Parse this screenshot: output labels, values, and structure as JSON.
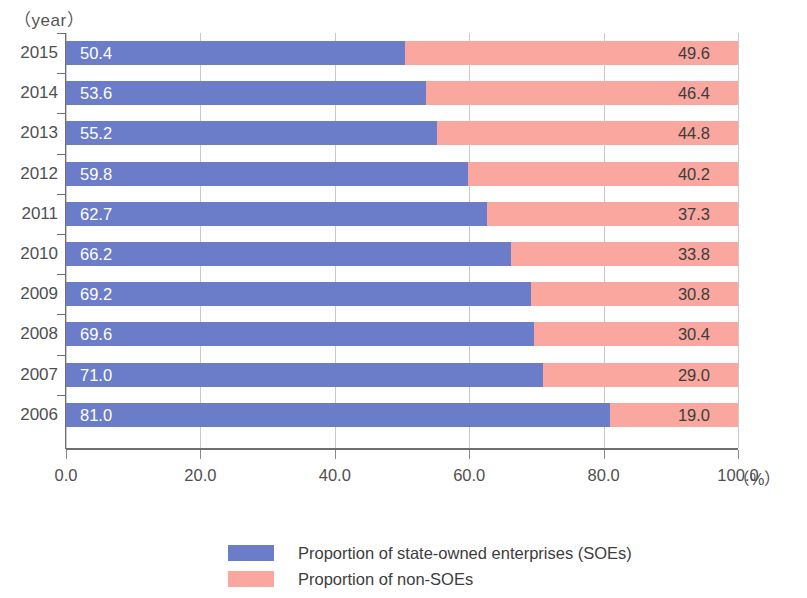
{
  "chart_data": {
    "type": "bar",
    "subtype": "stacked-horizontal-100-percent",
    "title": "",
    "xlabel": "(%)",
    "ylabel": "(year)",
    "xlim": [
      0,
      100
    ],
    "xticks": [
      "0.0",
      "20.0",
      "40.0",
      "60.0",
      "80.0",
      "100.0"
    ],
    "xtick_values": [
      0,
      20,
      40,
      60,
      80,
      100
    ],
    "grid": true,
    "grid_axis": "x",
    "legend_position": "bottom",
    "categories": [
      "2015",
      "2014",
      "2013",
      "2012",
      "2011",
      "2010",
      "2009",
      "2008",
      "2007",
      "2006"
    ],
    "series": [
      {
        "name": "Proportion of state-owned enterprises (SOEs)",
        "color": "#6b7cc8",
        "values": [
          50.4,
          53.6,
          55.2,
          59.8,
          62.7,
          66.2,
          69.2,
          69.6,
          71.0,
          81.0
        ],
        "labels": [
          "50.4",
          "53.6",
          "55.2",
          "59.8",
          "62.7",
          "66.2",
          "69.2",
          "69.6",
          "71.0",
          "81.0"
        ]
      },
      {
        "name": "Proportion of non-SOEs",
        "color": "#f9a79f",
        "values": [
          49.6,
          46.4,
          44.8,
          40.2,
          37.3,
          33.8,
          30.8,
          30.4,
          29.0,
          19.0
        ],
        "labels": [
          "49.6",
          "46.4",
          "44.8",
          "40.2",
          "37.3",
          "33.8",
          "30.8",
          "30.4",
          "29.0",
          "19.0"
        ]
      }
    ]
  },
  "axes": {
    "year_axis_title": "（year）",
    "x_unit": "（%）"
  },
  "legend": {
    "items": [
      {
        "label": "Proportion of state-owned enterprises (SOEs)",
        "color": "#6b7cc8"
      },
      {
        "label": "Proportion of non-SOEs",
        "color": "#f9a79f"
      }
    ]
  }
}
